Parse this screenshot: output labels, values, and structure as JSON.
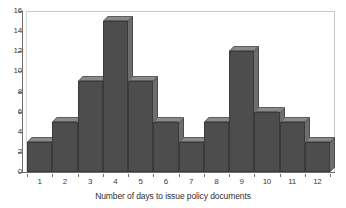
{
  "chart_data": {
    "type": "bar",
    "title": "",
    "xlabel": "Number of days to issue policy documents",
    "ylabel": "",
    "categories": [
      "1",
      "2",
      "3",
      "4",
      "5",
      "6",
      "7",
      "8",
      "9",
      "10",
      "11",
      "12"
    ],
    "values": [
      3,
      5,
      9,
      15,
      9,
      5,
      3,
      5,
      12,
      6,
      5,
      3
    ],
    "ylim": [
      0,
      16
    ],
    "y_ticks": [
      0,
      2,
      4,
      6,
      8,
      10,
      12,
      14,
      16
    ],
    "y_tick_labels": [
      "0",
      "2",
      "4",
      "6",
      "8",
      "10",
      "12",
      "14",
      "16"
    ],
    "grid": false,
    "legend": null,
    "style": "3d-histogram",
    "colors": {
      "bar_front": "#4d4d4d",
      "bar_top": "#8a8a8a",
      "bar_side": "#6d6d6d",
      "bar_outline": "#3a3a3a",
      "axis": "#6e6e6e",
      "frame": "#c9c9c9",
      "text": "#3b3b3b",
      "background": "#ffffff"
    }
  }
}
